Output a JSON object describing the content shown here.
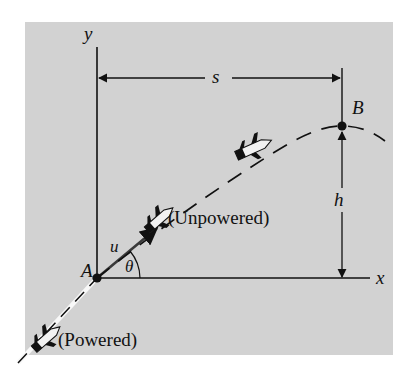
{
  "figure": {
    "background_color": "#ffffff",
    "panel_color": "#d2d2d2",
    "ink_color": "#111111"
  },
  "axes": {
    "y_label": "y",
    "x_label": "x",
    "origin_label": "A"
  },
  "points": [
    {
      "id": "A",
      "label": "A",
      "x": 97,
      "y": 278
    },
    {
      "id": "B",
      "label": "B",
      "x": 342,
      "y": 126
    }
  ],
  "dimensions": {
    "horizontal": {
      "label": "s",
      "from_x": 97,
      "to_x": 342,
      "y": 78
    },
    "vertical": {
      "label": "h",
      "x": 342,
      "from_y": 130,
      "to_y": 278
    }
  },
  "vector": {
    "speed_label": "u",
    "angle_label": "θ"
  },
  "annotations": [
    {
      "id": "powered",
      "label": "(Powered)",
      "x": 58,
      "y": 341
    },
    {
      "id": "unpowered",
      "label": "(Unpowered)",
      "x": 168,
      "y": 218
    }
  ],
  "trajectory": {
    "powered_style": "solid",
    "unpowered_style": "dashed",
    "rockets": [
      {
        "id": "rocket-powered",
        "x": 47,
        "y": 338,
        "angle": -39
      },
      {
        "id": "rocket-unpowered-1",
        "x": 160,
        "y": 220,
        "angle": -39
      },
      {
        "id": "rocket-unpowered-2",
        "x": 253,
        "y": 148,
        "angle": -23
      }
    ]
  }
}
